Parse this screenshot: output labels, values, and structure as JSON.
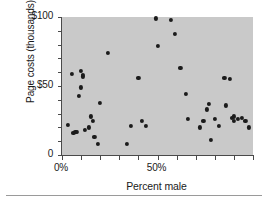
{
  "figure": {
    "background_color": "#ffffff",
    "plot_background_color": "#c9c9c9",
    "point_color": "#1b1b1b",
    "axis_color": "#4a4a4a"
  },
  "chart_data": {
    "type": "scatter",
    "title": "",
    "xlabel": "Percent male",
    "ylabel": "Page costs (thousands)",
    "xlim": [
      0,
      100
    ],
    "ylim": [
      0,
      100
    ],
    "grid": false,
    "legend": null,
    "x_tick_labels": [
      "0%",
      "50%"
    ],
    "x_tick_values": [
      0,
      50
    ],
    "x_minor_tick_values": [
      0,
      10,
      20,
      30,
      40,
      50,
      60,
      70,
      80,
      90,
      100
    ],
    "y_tick_labels": [
      "0",
      "$50",
      "$100"
    ],
    "y_tick_values": [
      0,
      50,
      100
    ],
    "y_minor_tick_values": [
      0,
      10,
      20,
      30,
      40,
      50,
      60,
      70,
      80,
      90,
      100
    ],
    "series": [
      {
        "name": "Journals",
        "points": [
          [
            3,
            22
          ],
          [
            5,
            59
          ],
          [
            6,
            16
          ],
          [
            7,
            17
          ],
          [
            8,
            17
          ],
          [
            9,
            43
          ],
          [
            10,
            49
          ],
          [
            10,
            61
          ],
          [
            11,
            58
          ],
          [
            11,
            57
          ],
          [
            12,
            18
          ],
          [
            14,
            20
          ],
          [
            15,
            28
          ],
          [
            16,
            25
          ],
          [
            17,
            13
          ],
          [
            19,
            8
          ],
          [
            20,
            38
          ],
          [
            24,
            74
          ],
          [
            34,
            8
          ],
          [
            36,
            21
          ],
          [
            40,
            56
          ],
          [
            42,
            25
          ],
          [
            44,
            21
          ],
          [
            49,
            99
          ],
          [
            50,
            79
          ],
          [
            57,
            98
          ],
          [
            59,
            88
          ],
          [
            62,
            63
          ],
          [
            65,
            44
          ],
          [
            66,
            26
          ],
          [
            72,
            20
          ],
          [
            74,
            25
          ],
          [
            76,
            33
          ],
          [
            77,
            37
          ],
          [
            78,
            11
          ],
          [
            80,
            26
          ],
          [
            82,
            21
          ],
          [
            85,
            56
          ],
          [
            86,
            36
          ],
          [
            88,
            55
          ],
          [
            89,
            27
          ],
          [
            90,
            25
          ],
          [
            90,
            28
          ],
          [
            92,
            26
          ],
          [
            94,
            27
          ],
          [
            96,
            25
          ],
          [
            98,
            20
          ]
        ]
      }
    ]
  }
}
